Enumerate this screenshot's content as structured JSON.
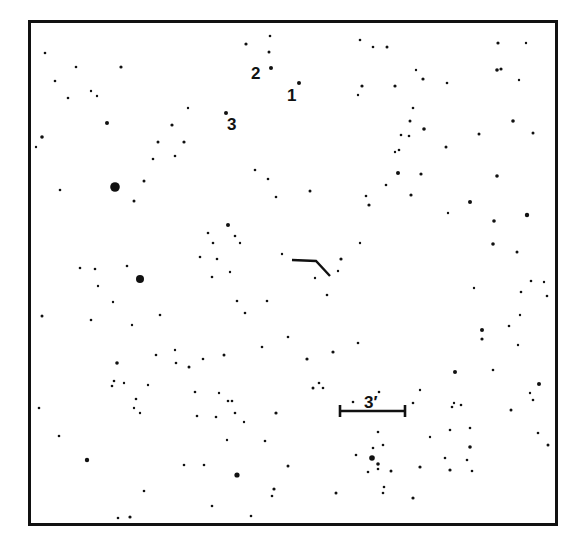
{
  "finder_chart": {
    "frame": {
      "x": 28,
      "y": 20,
      "width": 530,
      "height": 506,
      "color": "#111111"
    },
    "labels": [
      {
        "id": "2",
        "text": "2",
        "x": 251,
        "y": 65
      },
      {
        "id": "1",
        "text": "1",
        "x": 287,
        "y": 87
      },
      {
        "id": "3",
        "text": "3",
        "x": 227,
        "y": 116
      }
    ],
    "scale_bar": {
      "label": "3′",
      "x1": 340,
      "x2": 405,
      "y": 411,
      "label_x": 364,
      "label_y": 394
    },
    "target_marker": {
      "points": "292,260 316,261 330,276"
    },
    "stars": [
      [
        246,
        44,
        1.6
      ],
      [
        270,
        36,
        1.3
      ],
      [
        269,
        52,
        1.5
      ],
      [
        271,
        68,
        2
      ],
      [
        299,
        83,
        2
      ],
      [
        226,
        113,
        2
      ],
      [
        45,
        53,
        1.3
      ],
      [
        76,
        67,
        1.3
      ],
      [
        121,
        67,
        1.6
      ],
      [
        55,
        81,
        1.3
      ],
      [
        91,
        91,
        1.2
      ],
      [
        97,
        96,
        1.2
      ],
      [
        68,
        98,
        1.3
      ],
      [
        42,
        137,
        1.8
      ],
      [
        107,
        123,
        2
      ],
      [
        36,
        147,
        1.2
      ],
      [
        60,
        190,
        1.3
      ],
      [
        115,
        187,
        4.8
      ],
      [
        144,
        181,
        1.5
      ],
      [
        188,
        108,
        1.2
      ],
      [
        172,
        125,
        1.6
      ],
      [
        184,
        142,
        1.6
      ],
      [
        158,
        142,
        1.5
      ],
      [
        134,
        201,
        1.5
      ],
      [
        153,
        159,
        1.3
      ],
      [
        175,
        156,
        1.3
      ],
      [
        360,
        40,
        1.3
      ],
      [
        373,
        47,
        1.3
      ],
      [
        387,
        47,
        1.5
      ],
      [
        498,
        43,
        1.6
      ],
      [
        526,
        43,
        1.2
      ],
      [
        416,
        70,
        1.2
      ],
      [
        423,
        79,
        1.6
      ],
      [
        497,
        70,
        1.8
      ],
      [
        501,
        69,
        1.6
      ],
      [
        362,
        86,
        1.6
      ],
      [
        395,
        86,
        1.6
      ],
      [
        447,
        83,
        1.3
      ],
      [
        358,
        95,
        1.2
      ],
      [
        410,
        121,
        1.5
      ],
      [
        424,
        129,
        1.8
      ],
      [
        413,
        108,
        1.3
      ],
      [
        446,
        147,
        1.5
      ],
      [
        513,
        121,
        1.8
      ],
      [
        519,
        80,
        1.2
      ],
      [
        401,
        135,
        1.3
      ],
      [
        409,
        136,
        1.3
      ],
      [
        479,
        134,
        1.5
      ],
      [
        395,
        152,
        1.2
      ],
      [
        497,
        176,
        1.8
      ],
      [
        421,
        174,
        1.6
      ],
      [
        533,
        133,
        1.5
      ],
      [
        398,
        173,
        2
      ],
      [
        386,
        185,
        1.3
      ],
      [
        470,
        202,
        2
      ],
      [
        366,
        196,
        1.3
      ],
      [
        411,
        195,
        1.6
      ],
      [
        399,
        150,
        1.3
      ],
      [
        360,
        243,
        1.2
      ],
      [
        448,
        213,
        1.2
      ],
      [
        527,
        215,
        2.2
      ],
      [
        494,
        221,
        1.8
      ],
      [
        493,
        244,
        1.8
      ],
      [
        255,
        170,
        1.3
      ],
      [
        268,
        179,
        1.3
      ],
      [
        276,
        197,
        1.3
      ],
      [
        310,
        191,
        1.5
      ],
      [
        369,
        205,
        1.6
      ],
      [
        341,
        259,
        1.6
      ],
      [
        338,
        271,
        1.2
      ],
      [
        315,
        278,
        1.2
      ],
      [
        327,
        295,
        1.3
      ],
      [
        282,
        254,
        1.2
      ],
      [
        228,
        225,
        2
      ],
      [
        235,
        236,
        1.3
      ],
      [
        208,
        233,
        1.3
      ],
      [
        213,
        243,
        1.3
      ],
      [
        240,
        243,
        1.2
      ],
      [
        230,
        272,
        1.2
      ],
      [
        217,
        259,
        1.3
      ],
      [
        212,
        277,
        1.3
      ],
      [
        200,
        257,
        1.3
      ],
      [
        245,
        313,
        1.3
      ],
      [
        140,
        279,
        4
      ],
      [
        127,
        266,
        1.3
      ],
      [
        42,
        316,
        1.5
      ],
      [
        95,
        269,
        1.3
      ],
      [
        80,
        268,
        1.3
      ],
      [
        98,
        286,
        1.2
      ],
      [
        113,
        302,
        1.2
      ],
      [
        91,
        320,
        1.3
      ],
      [
        132,
        325,
        1.2
      ],
      [
        160,
        315,
        1.3
      ],
      [
        175,
        350,
        1.2
      ],
      [
        156,
        355,
        1.3
      ],
      [
        176,
        363,
        1.3
      ],
      [
        203,
        359,
        1.3
      ],
      [
        189,
        367,
        1.5
      ],
      [
        224,
        355,
        1.5
      ],
      [
        195,
        392,
        1.3
      ],
      [
        219,
        393,
        1.2
      ],
      [
        228,
        401,
        1.3
      ],
      [
        232,
        401,
        1.3
      ],
      [
        197,
        416,
        1.3
      ],
      [
        262,
        347,
        1.3
      ],
      [
        237,
        301,
        1.3
      ],
      [
        267,
        301,
        1.3
      ],
      [
        288,
        337,
        1.3
      ],
      [
        333,
        352,
        1.6
      ],
      [
        358,
        343,
        1.3
      ],
      [
        482,
        339,
        1.6
      ],
      [
        518,
        345,
        1.2
      ],
      [
        474,
        288,
        1.2
      ],
      [
        482,
        330,
        2
      ],
      [
        509,
        326,
        1.3
      ],
      [
        521,
        292,
        1.3
      ],
      [
        547,
        296,
        1.3
      ],
      [
        517,
        252,
        1.5
      ],
      [
        531,
        281,
        1.3
      ],
      [
        544,
        282,
        1.2
      ],
      [
        520,
        315,
        1.2
      ],
      [
        539,
        384,
        2
      ],
      [
        511,
        410,
        1.5
      ],
      [
        533,
        400,
        1.3
      ],
      [
        454,
        403,
        1.2
      ],
      [
        452,
        407,
        1.3
      ],
      [
        493,
        370,
        1.3
      ],
      [
        117,
        363,
        1.8
      ],
      [
        112,
        386,
        1.3
      ],
      [
        114,
        381,
        1.3
      ],
      [
        124,
        383,
        1.2
      ],
      [
        148,
        385,
        1.2
      ],
      [
        136,
        399,
        1.3
      ],
      [
        140,
        413,
        1.2
      ],
      [
        134,
        408,
        1.2
      ],
      [
        39,
        408,
        1.3
      ],
      [
        59,
        436,
        1.3
      ],
      [
        87,
        460,
        2.2
      ],
      [
        144,
        491,
        1.3
      ],
      [
        118,
        518,
        1.3
      ],
      [
        130,
        517,
        1.6
      ],
      [
        216,
        417,
        1.3
      ],
      [
        227,
        440,
        1.2
      ],
      [
        235,
        413,
        1.3
      ],
      [
        276,
        413,
        1.6
      ],
      [
        265,
        441,
        1.3
      ],
      [
        288,
        466,
        1.5
      ],
      [
        313,
        388,
        1.5
      ],
      [
        319,
        383,
        1.3
      ],
      [
        353,
        402,
        1.3
      ],
      [
        379,
        392,
        1.3
      ],
      [
        237,
        475,
        2.6
      ],
      [
        184,
        465,
        1.3
      ],
      [
        204,
        465,
        1.3
      ],
      [
        212,
        506,
        1.3
      ],
      [
        251,
        516,
        1.3
      ],
      [
        274,
        489,
        1.6
      ],
      [
        272,
        496,
        1.3
      ],
      [
        336,
        493,
        1.5
      ],
      [
        383,
        493,
        1.3
      ],
      [
        307,
        359,
        1.6
      ],
      [
        323,
        388,
        1.3
      ],
      [
        372,
        458,
        2.8
      ],
      [
        378,
        464,
        1.8
      ],
      [
        378,
        469,
        1.3
      ],
      [
        368,
        472,
        1.3
      ],
      [
        378,
        432,
        1.3
      ],
      [
        373,
        448,
        1.3
      ],
      [
        383,
        445,
        1.3
      ],
      [
        391,
        471,
        1.5
      ],
      [
        384,
        487,
        1.3
      ],
      [
        413,
        498,
        1.6
      ],
      [
        420,
        467,
        1.6
      ],
      [
        430,
        437,
        1.2
      ],
      [
        450,
        430,
        1.3
      ],
      [
        470,
        428,
        1.3
      ],
      [
        470,
        447,
        1.8
      ],
      [
        445,
        458,
        1.3
      ],
      [
        450,
        470,
        1.6
      ],
      [
        467,
        460,
        1.3
      ],
      [
        472,
        471,
        1.3
      ],
      [
        461,
        405,
        1.3
      ],
      [
        413,
        403,
        1.3
      ],
      [
        455,
        372,
        2
      ],
      [
        420,
        390,
        1.2
      ],
      [
        538,
        433,
        1.3
      ],
      [
        548,
        445,
        1.5
      ],
      [
        530,
        393,
        1.2
      ],
      [
        356,
        455,
        1.3
      ],
      [
        244,
        422,
        1.2
      ]
    ]
  }
}
